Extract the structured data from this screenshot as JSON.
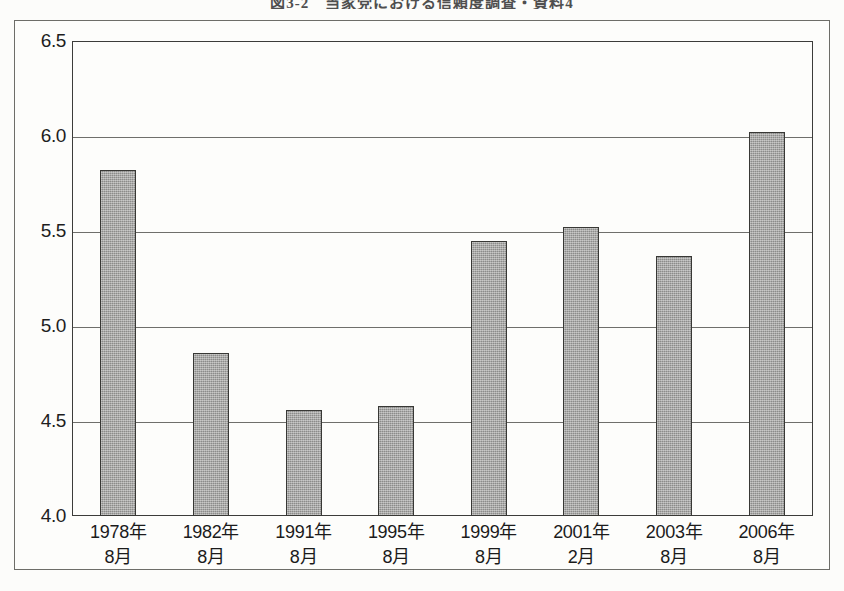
{
  "document": {
    "caption": "図3-2　当家党における信頼度調査・資料4",
    "caption_visible_note": "cropped at top edge"
  },
  "chart_data": {
    "type": "bar",
    "title": "",
    "xlabel": "",
    "ylabel": "",
    "ylim": [
      4.0,
      6.5
    ],
    "ytick_step": 0.5,
    "grid": true,
    "legend": null,
    "categories": [
      "1978年\n8月",
      "1982年\n8月",
      "1991年\n8月",
      "1995年\n8月",
      "1999年\n8月",
      "2001年\n2月",
      "2003年\n8月",
      "2006年\n8月"
    ],
    "category_parts": [
      {
        "year": "1978年",
        "month": "8月"
      },
      {
        "year": "1982年",
        "month": "8月"
      },
      {
        "year": "1991年",
        "month": "8月"
      },
      {
        "year": "1995年",
        "month": "8月"
      },
      {
        "year": "1999年",
        "month": "8月"
      },
      {
        "year": "2001年",
        "month": "2月"
      },
      {
        "year": "2003年",
        "month": "8月"
      },
      {
        "year": "2006年",
        "month": "8月"
      }
    ],
    "values": [
      5.82,
      4.86,
      4.56,
      4.58,
      5.45,
      5.52,
      5.37,
      6.02
    ],
    "ytick_labels": [
      "4.0",
      "4.5",
      "5.0",
      "5.5",
      "6.0",
      "6.5"
    ],
    "ytick_values": [
      4.0,
      4.5,
      5.0,
      5.5,
      6.0,
      6.5
    ]
  },
  "style": {
    "bar_fill": "#9a9a98",
    "bar_border": "#383835",
    "grid_color": "#6f6f6b",
    "axis_color": "#3c3c3a",
    "frame_color": "#6d6d68",
    "paper": "#fdfdfb",
    "text": "#1b1b1b"
  }
}
